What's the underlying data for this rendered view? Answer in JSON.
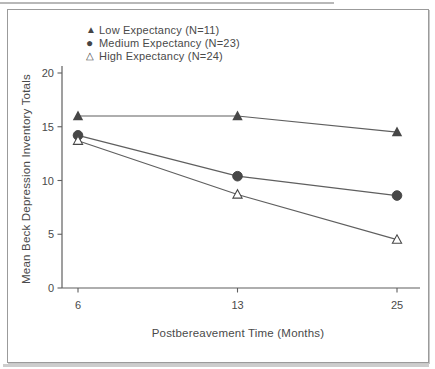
{
  "chart_data": {
    "type": "line",
    "x_values": [
      6,
      13,
      25
    ],
    "x_categories": [
      "6",
      "13",
      "25"
    ],
    "x_spacing": "equal",
    "series": [
      {
        "name": "Low Expectancy (N=11)",
        "marker": "filled-triangle",
        "values": [
          16.0,
          16.0,
          14.5
        ]
      },
      {
        "name": "Medium Expectancy (N=23)",
        "marker": "filled-circle",
        "values": [
          14.2,
          10.4,
          8.6
        ]
      },
      {
        "name": "High Expectancy (N=24)",
        "marker": "open-triangle",
        "values": [
          13.7,
          8.7,
          4.5
        ]
      }
    ],
    "xlabel": "Postbereavement Time (Months)",
    "ylabel": "Mean Beck Depression Inventory Totals",
    "ylim": [
      0,
      20
    ],
    "yticks": [
      0,
      5,
      10,
      15,
      20
    ],
    "grid": false,
    "legend_position": "top-center-inside",
    "ink_color": "#474747",
    "line_color": "#5f5f5f",
    "frame_color": "#9b9b9b",
    "background_color": "#ffffff"
  },
  "icons": {
    "filled-triangle": "▲",
    "filled-circle": "●",
    "open-triangle": "△"
  }
}
